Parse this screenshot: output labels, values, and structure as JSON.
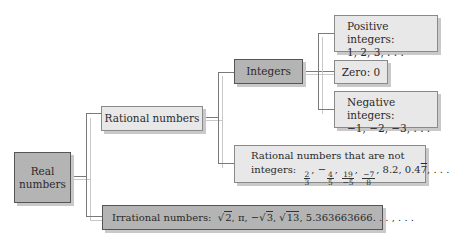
{
  "diagram": {
    "nodes": {
      "real": {
        "label_line1": "Real",
        "label_line2": "numbers"
      },
      "rational": {
        "label": "Rational numbers"
      },
      "irrational": {
        "label": "Irrational numbers:",
        "examples": [
          "√2",
          "π",
          "−√3",
          "√13",
          "5.363663666. . . , . . ."
        ],
        "sqrt2": "2",
        "pi": "π",
        "neg": "−",
        "sqrt3": "3",
        "sqrt13": "13",
        "tail": "5.363663666. . . , . . ."
      },
      "integers": {
        "label": "Integers"
      },
      "rational_not_integers": {
        "label_line1": "Rational numbers that are not",
        "label_line2": "integers:",
        "fractions": [
          {
            "sign": "",
            "num": "2",
            "den": "3"
          },
          {
            "sign": "−",
            "num": "4",
            "den": "5"
          },
          {
            "sign": "",
            "num": "19",
            "den": "−5"
          },
          {
            "sign": "",
            "num": "−7",
            "den": "8"
          }
        ],
        "decimal1": "8.2",
        "decimal2_base": "0.4",
        "decimal2_repeat": "7",
        "ellipsis": ". . ."
      },
      "positive": {
        "label": "Positive integers:",
        "examples": "1, 2, 3, . . ."
      },
      "zero": {
        "label": "Zero: 0"
      },
      "negative": {
        "label": "Negative integers:",
        "examples": "−1, −2, −3, . . ."
      }
    },
    "colors": {
      "dark_box": "#b4b4b4",
      "light_box": "#e8e8e8",
      "line": "#7a7a7a"
    }
  }
}
